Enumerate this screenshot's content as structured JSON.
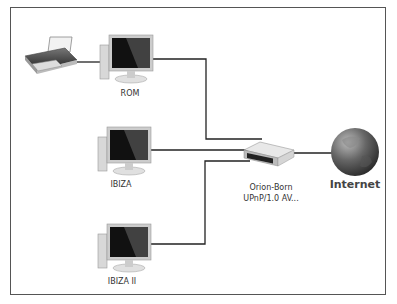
{
  "diagram": {
    "type": "network-map",
    "nodes": [
      {
        "id": "printer",
        "label": "",
        "icon": "printer-icon"
      },
      {
        "id": "rom",
        "label": "ROM",
        "icon": "computer-icon"
      },
      {
        "id": "ibiza",
        "label": "IBIZA",
        "icon": "computer-icon"
      },
      {
        "id": "ibiza2",
        "label": "IBIZA II",
        "icon": "computer-icon"
      },
      {
        "id": "router",
        "label_line1": "Orion-Born",
        "label_line2": "UPnP/1.0 AV...",
        "icon": "router-icon"
      },
      {
        "id": "internet",
        "label": "Internet",
        "icon": "globe-icon"
      }
    ],
    "edges": [
      [
        "printer",
        "rom"
      ],
      [
        "rom",
        "router"
      ],
      [
        "ibiza",
        "router"
      ],
      [
        "ibiza2",
        "router"
      ],
      [
        "router",
        "internet"
      ]
    ],
    "colors": {
      "line": "#222222",
      "border": "#555555",
      "globe": "#5a5a5a"
    }
  }
}
